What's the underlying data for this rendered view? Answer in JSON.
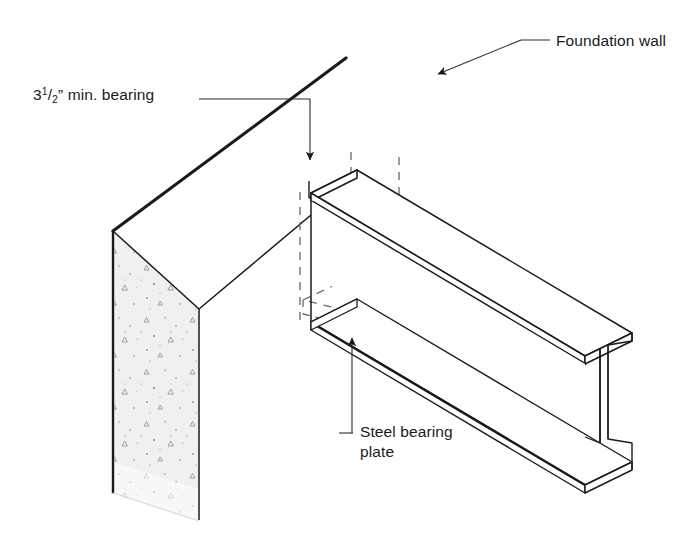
{
  "diagram": {
    "type": "isometric-construction-detail",
    "background_color": "#ffffff",
    "line_color": "#1a1a1a",
    "concrete_fill_color": "#efefef",
    "concrete_edge_color": "#e3e3e3",
    "steel_fill_color": "#ffffff",
    "leader_color": "#2b2b2b"
  },
  "labels": {
    "foundation_wall": {
      "text": "Foundation wall",
      "x": 556,
      "y": 46
    },
    "bearing": {
      "prefix": "3",
      "numerator": "1",
      "slash": "/",
      "denominator": "2",
      "suffix": "” min. bearing",
      "full_text": "3 1/2” min. bearing",
      "x": 33,
      "y": 100
    },
    "steel_bearing_plate": {
      "line1": "Steel bearing",
      "line2": "plate",
      "x": 360,
      "y": 437
    }
  },
  "annotations": {
    "foundation_wall_leader": "elbow leader with solid arrowhead pointing down-left to wall top face",
    "bearing_leader": "horizontal leader turning down with solid arrowhead at beam bearing point",
    "plate_leader": "vertical leader with solid arrowhead pointing up at steel bearing plate"
  },
  "components": {
    "foundation_wall": "cast-in-place concrete wall shown with aggregate stipple hatching",
    "steel_beam": "wide-flange (I-beam) steel beam in isometric projection",
    "bearing_plate": "steel bearing plate shown in hidden (dashed) lines inside wall pocket"
  }
}
